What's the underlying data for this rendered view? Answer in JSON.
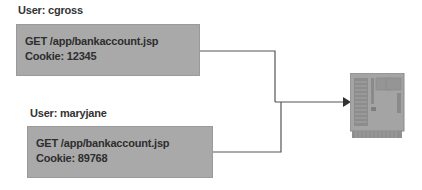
{
  "requests": [
    {
      "user_label": "User: cgross",
      "method_line": "GET /app/bankaccount.jsp",
      "cookie_line": "Cookie: 12345"
    },
    {
      "user_label": "User: maryjane",
      "method_line": "GET /app/bankaccount.jsp",
      "cookie_line": "Cookie: 89768"
    }
  ],
  "target": {
    "icon": "server-icon"
  },
  "colors": {
    "box_fill": "#a9a9a9",
    "line": "#555555",
    "server": "#9c9c9c"
  }
}
